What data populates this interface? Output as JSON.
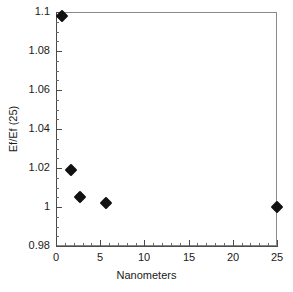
{
  "chart_data": {
    "type": "scatter",
    "title": "",
    "xlabel": "Nanometers",
    "ylabel": "Ef/Ef (25)",
    "xlim": [
      0,
      25
    ],
    "ylim": [
      0.98,
      1.1
    ],
    "x_major_ticks": [
      0,
      5,
      10,
      15,
      20,
      25
    ],
    "x_tick_labels": [
      "0",
      "5",
      "10",
      "15",
      "20",
      "25"
    ],
    "x_minor_tick_step": 1,
    "y_major_ticks": [
      0.98,
      1.0,
      1.02,
      1.04,
      1.06,
      1.08,
      1.1
    ],
    "y_tick_labels": [
      "0.98",
      "1",
      "1.02",
      "1.04",
      "1.06",
      "1.08",
      "1.1"
    ],
    "y_minor_tick_step": 0.005,
    "grid": false,
    "legend": null,
    "marker": "filled-diamond",
    "marker_color": "#111111",
    "series": [
      {
        "name": "Ef/Ef (25)",
        "points": [
          {
            "x": 0.7,
            "y": 1.098
          },
          {
            "x": 1.7,
            "y": 1.019
          },
          {
            "x": 2.7,
            "y": 1.005
          },
          {
            "x": 5.7,
            "y": 1.002
          },
          {
            "x": 25.0,
            "y": 1.0
          }
        ]
      }
    ]
  },
  "axes": {
    "frame_color": "#8a8a8a",
    "axis_color": "#4a4a4a"
  }
}
